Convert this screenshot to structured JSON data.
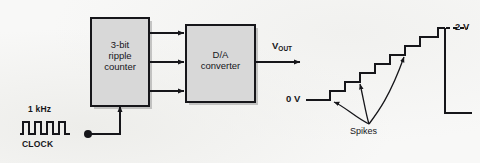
{
  "figure": {
    "type": "block-diagram-with-waveforms",
    "background_color": "#f8f8f7",
    "ink_color": "#16161a",
    "box_fill_color": "#d6d6d6"
  },
  "blocks": [
    {
      "id": "ripple-counter",
      "line1": "3-bit",
      "line2": "ripple",
      "line3": "counter",
      "x": 91,
      "y": 18,
      "w": 58,
      "h": 88
    },
    {
      "id": "da-converter",
      "line1": "D/A",
      "line2": "converter",
      "x": 186,
      "y": 25,
      "w": 69,
      "h": 77
    }
  ],
  "signals": {
    "clock_frequency": "1 kHz",
    "clock_name": "CLOCK",
    "output_name_base": "V",
    "output_name_sub": "OUT",
    "bus_width_arrows": 3
  },
  "waveform": {
    "clock": {
      "label_top": "1 kHz",
      "label_bottom": "CLOCK",
      "pulses": 4,
      "x_start": 20,
      "x_end": 70,
      "y_high": 122,
      "y_low": 134
    },
    "staircase": {
      "low_label": "0 V",
      "high_label": "2 V",
      "spikes_label": "Spikes",
      "steps": 8,
      "step_levels": [
        0,
        1,
        2,
        3,
        4,
        5,
        6,
        7
      ],
      "level_min_volts": 0,
      "level_max_volts": 2,
      "spike_arrow_count": 3
    }
  },
  "labels": {
    "clock_freq": "1 kHz",
    "clock_name": "CLOCK",
    "vout_base": "V",
    "vout_sub": "OUT",
    "zero_volt": "0 V",
    "two_volt": "2 V",
    "spikes": "Spikes",
    "block1_l1": "3-bit",
    "block1_l2": "ripple",
    "block1_l3": "counter",
    "block2_l1": "D/A",
    "block2_l2": "converter"
  }
}
